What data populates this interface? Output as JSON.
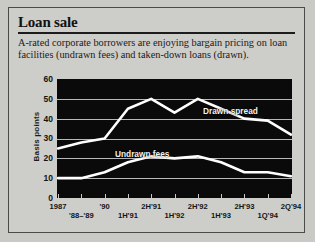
{
  "figure": {
    "headline": "Loan sale",
    "deck": "A-rated corporate borrowers are enjoying bargain pricing on loan facilities (undrawn fees) and taken-down loans (drawn)."
  },
  "chart_data": {
    "type": "line",
    "title": "Loan sale",
    "xlabel": "",
    "ylabel": "Basis points",
    "ylim": [
      0,
      60
    ],
    "yticks": [
      0,
      10,
      20,
      30,
      40,
      50,
      60
    ],
    "grid": true,
    "legend_position": "inline-right",
    "background": "#0a0a0a",
    "line_color": "#ffffff",
    "categories": [
      "1987",
      "'88-'89",
      "'90",
      "1H'91",
      "2H'91",
      "1H'92",
      "2H'92",
      "1H'93",
      "2H'93",
      "1Q'94",
      "2Q'94"
    ],
    "xtick_labels_top": [
      "1987",
      "",
      "'90",
      "",
      "2H'91",
      "",
      "2H'92",
      "",
      "2H'93",
      "",
      "2Q'94"
    ],
    "xtick_labels_bottom": [
      "",
      "'88–'89",
      "",
      "1H'91",
      "",
      "1H'92",
      "",
      "1H'93",
      "",
      "1Q'94",
      ""
    ],
    "series": [
      {
        "name": "Drawn spread",
        "values": [
          25,
          28,
          30,
          45,
          50,
          43,
          50,
          45,
          40,
          39,
          32
        ]
      },
      {
        "name": "Undrawn fees",
        "values": [
          10,
          10,
          13,
          18,
          21,
          20,
          21,
          18,
          13,
          13,
          11
        ]
      }
    ],
    "annotations": [
      {
        "text": "Drawn spread",
        "series": "Drawn spread"
      },
      {
        "text": "Undrawn fees",
        "series": "Undrawn fees"
      }
    ]
  }
}
